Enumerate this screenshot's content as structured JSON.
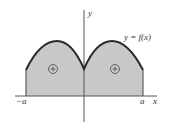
{
  "figure": {
    "type": "area-under-curve",
    "curve_label": "y = f(x)",
    "axis_labels": {
      "x": "x",
      "y": "y"
    },
    "tick_labels": {
      "left": "−a",
      "right": "a"
    },
    "region_signs": [
      "+",
      "+"
    ],
    "colors": {
      "fill": "#c8c8c8",
      "curve": "#2a2a2a",
      "axes": "#555555",
      "text": "#333333"
    }
  }
}
